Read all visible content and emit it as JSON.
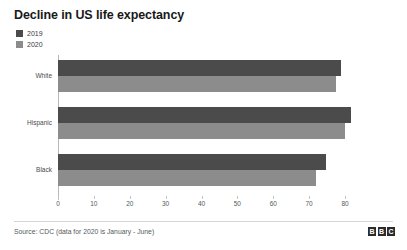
{
  "chart_data": {
    "type": "bar",
    "orientation": "horizontal",
    "title": "Decline in US life expectancy",
    "xlabel": "",
    "ylabel": "",
    "categories": [
      "White",
      "Hispanic",
      "Black"
    ],
    "series": [
      {
        "name": "2019",
        "color": "#4b4b4b",
        "values": [
          78.8,
          81.8,
          74.7
        ]
      },
      {
        "name": "2020",
        "color": "#8c8c8c",
        "values": [
          77.6,
          79.9,
          72.0
        ]
      }
    ],
    "xlim": [
      0,
      80
    ],
    "xticks": [
      0,
      10,
      20,
      30,
      40,
      50,
      60,
      70,
      80
    ],
    "xtick_labels": [
      "0",
      "10",
      "20",
      "30",
      "40",
      "50",
      "60",
      "70",
      "80"
    ],
    "grid": false,
    "legend_position": "top-left"
  },
  "legend": {
    "items": [
      {
        "label": "2019",
        "color": "#4b4b4b"
      },
      {
        "label": "2020",
        "color": "#8c8c8c"
      }
    ]
  },
  "footer": {
    "source": "Source: CDC (data for 2020 is January - June)",
    "logo": [
      "B",
      "B",
      "C"
    ]
  }
}
